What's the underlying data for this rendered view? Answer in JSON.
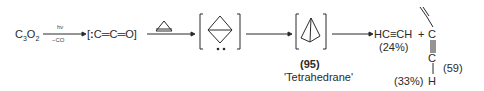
{
  "scheme": {
    "reactant": {
      "text": "C",
      "sub1": "3",
      "mid": "O",
      "sub2": "2"
    },
    "step1": {
      "above": "hν",
      "below": "−CO"
    },
    "intermediate1": "[:C=C=O]",
    "intermediate1_parts": {
      "open": "[",
      "dots": ":",
      "formula": "C═C═O",
      "close": "]"
    },
    "step2_reagent": "cyclopropene",
    "intermediate2": "tetrahedral carbene (bicyclobutylidene)",
    "product_main": {
      "label": "(95)",
      "name": "'Tetrahedrane'"
    },
    "products": {
      "acetylene": {
        "formula": "HC≡CH",
        "yield": "(24%)"
      },
      "plus": "+",
      "vinylacetylene": {
        "top": "C",
        "bottom": "C",
        "h": "H",
        "yield": "(33%)"
      },
      "equation_number": "(59)"
    }
  }
}
